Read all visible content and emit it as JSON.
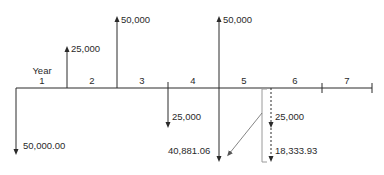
{
  "diagram": {
    "type": "cash-flow-diagram",
    "axis_label": "Year",
    "colors": {
      "line": "#2a2a2a",
      "bracket": "#9a9a9a",
      "background": "#ffffff"
    },
    "periods": [
      {
        "label": "1",
        "x": 42
      },
      {
        "label": "2",
        "x": 92
      },
      {
        "label": "3",
        "x": 142
      },
      {
        "label": "4",
        "x": 193
      },
      {
        "label": "5",
        "x": 244
      },
      {
        "label": "6",
        "x": 295
      },
      {
        "label": "7",
        "x": 347
      }
    ],
    "cash_flows": [
      {
        "id": "out-0",
        "direction": "down",
        "x": 16,
        "value": "50,000.00"
      },
      {
        "id": "in-1",
        "direction": "up",
        "x": 67,
        "value": "25,000"
      },
      {
        "id": "in-2",
        "direction": "up",
        "x": 117,
        "value": "50,000"
      },
      {
        "id": "out-3",
        "direction": "down",
        "x": 168,
        "value": "25,000"
      },
      {
        "id": "in-4",
        "direction": "up",
        "x": 219,
        "value": "50,000"
      },
      {
        "id": "out-4",
        "direction": "down",
        "x": 219,
        "value": "40,881.06"
      },
      {
        "id": "out-5a",
        "direction": "down",
        "style": "dashed",
        "x": 271,
        "value": "25,000"
      },
      {
        "id": "out-5b",
        "direction": "down",
        "style": "dashed",
        "x": 271,
        "value": "18,333.93"
      }
    ]
  }
}
